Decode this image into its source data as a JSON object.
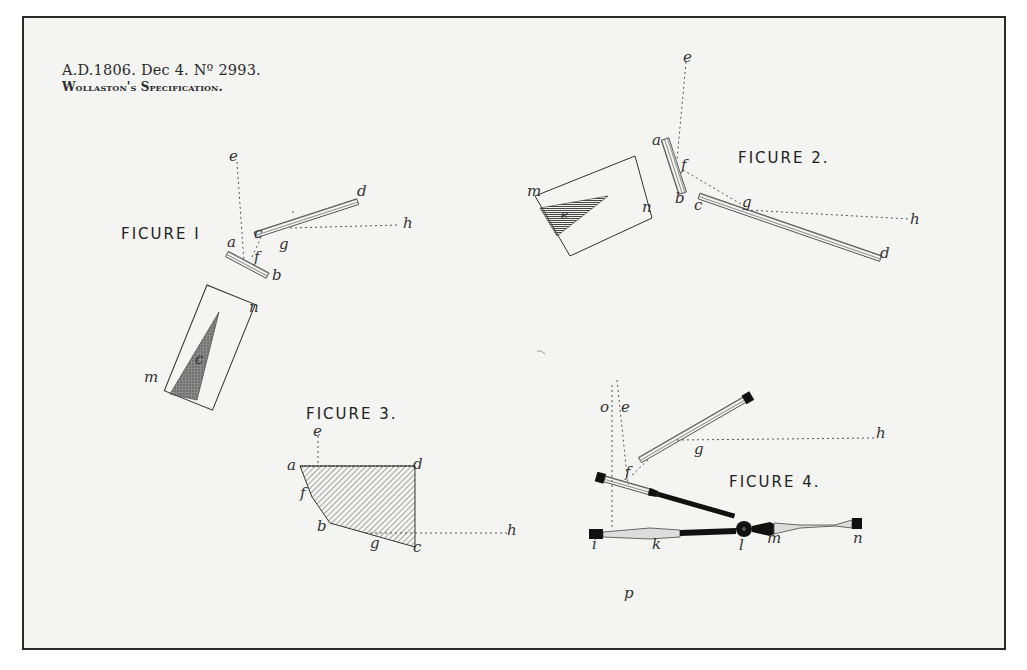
{
  "document": {
    "header": {
      "line1": "A.D.1806. Dec 4. Nº 2993.",
      "line2": "Wollaston's Specification."
    },
    "colors": {
      "paper": "#f4f4f2",
      "border": "#2a2a2a",
      "ink": "#222222",
      "hatch": "#555555",
      "shade": "#6e6e6e",
      "solid": "#111111"
    },
    "figures": [
      {
        "id": "figure-1",
        "title": "FICURE I",
        "labels": [
          "a",
          "b",
          "c",
          "d",
          "e",
          "f",
          "g",
          "h",
          "m",
          "n",
          "c"
        ]
      },
      {
        "id": "figure-2",
        "title": "FICURE 2.",
        "labels": [
          "a",
          "b",
          "c",
          "d",
          "e",
          "f",
          "g",
          "h",
          "m",
          "n",
          "e"
        ]
      },
      {
        "id": "figure-3",
        "title": "FICURE 3.",
        "labels": [
          "a",
          "b",
          "c",
          "d",
          "e",
          "f",
          "g",
          "h"
        ]
      },
      {
        "id": "figure-4",
        "title": "FICURE 4.",
        "labels": [
          "o",
          "e",
          "f",
          "g",
          "h",
          "i",
          "k",
          "l",
          "m",
          "n",
          "p"
        ]
      }
    ]
  }
}
